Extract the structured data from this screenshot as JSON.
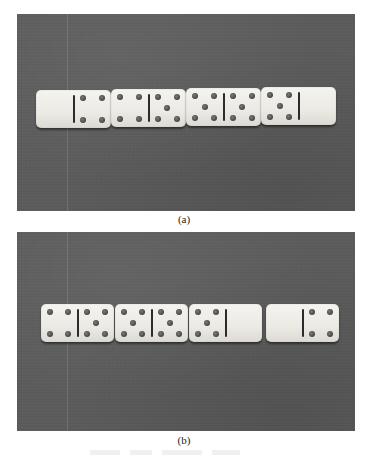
{
  "figure": {
    "panels": [
      {
        "label": "(a)",
        "description": "Four dominoes in a row on a gray surface",
        "dominoes": [
          {
            "left": 0,
            "right": 4
          },
          {
            "left": 4,
            "right": 5
          },
          {
            "left": 5,
            "right": 5
          },
          {
            "left": 5,
            "right": 0
          }
        ],
        "gap_before_last": false
      },
      {
        "label": "(b)",
        "description": "The same four dominoes rearranged, with a gap before the last",
        "dominoes": [
          {
            "left": 4,
            "right": 5
          },
          {
            "left": 5,
            "right": 5
          },
          {
            "left": 5,
            "right": 0
          },
          {
            "left": 0,
            "right": 4
          }
        ],
        "gap_before_last": true
      }
    ],
    "colors": {
      "background": "#5b5b5b",
      "tile": "#eeece7",
      "pip": "#555555",
      "divider": "#2c2c2c"
    }
  }
}
